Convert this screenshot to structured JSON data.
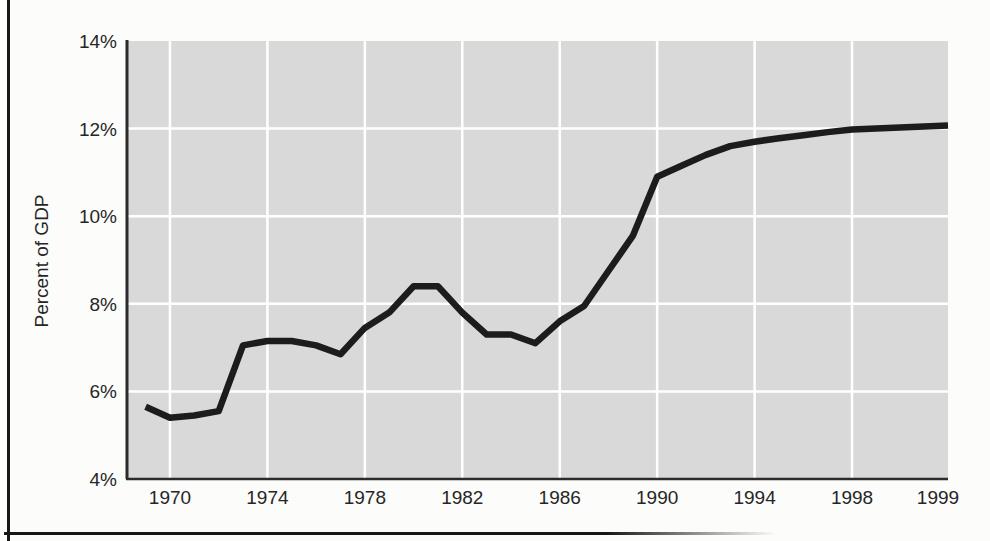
{
  "figure": {
    "ylabel": "Percent of GDP",
    "colors": {
      "plot_background": "#d9d9d9",
      "gridline": "#ffffff",
      "axis_line": "#2b2b2b",
      "data_line": "#1c1c1c",
      "page_background": "#fcfcfa",
      "text": "#262626",
      "frame": "#161616"
    }
  },
  "chart_data": {
    "type": "line",
    "title": "",
    "xlabel": "",
    "ylabel": "Percent of GDP",
    "x": [
      1969,
      1970,
      1971,
      1972,
      1973,
      1974,
      1975,
      1976,
      1977,
      1978,
      1979,
      1980,
      1981,
      1982,
      1983,
      1984,
      1985,
      1986,
      1987,
      1988,
      1989,
      1990,
      1991,
      1992,
      1993,
      1994,
      1995,
      1996,
      1997,
      1998,
      1999
    ],
    "values": [
      5.65,
      5.4,
      5.45,
      5.55,
      7.05,
      7.15,
      7.15,
      7.05,
      6.85,
      7.45,
      7.8,
      8.4,
      8.4,
      7.8,
      7.3,
      7.3,
      7.1,
      7.6,
      7.95,
      8.75,
      9.55,
      10.9,
      11.15,
      11.4,
      11.6,
      11.7,
      11.78,
      11.85,
      11.92,
      11.98,
      12.07
    ],
    "x_ticks": [
      {
        "year": 1970,
        "label": "1970"
      },
      {
        "year": 1974,
        "label": "1974"
      },
      {
        "year": 1978,
        "label": "1978"
      },
      {
        "year": 1982,
        "label": "1982"
      },
      {
        "year": 1986,
        "label": "1986"
      },
      {
        "year": 1990,
        "label": "1990"
      },
      {
        "year": 1994,
        "label": "1994"
      },
      {
        "year": 1998,
        "label": "1998"
      },
      {
        "year": 1999,
        "label": "1999"
      }
    ],
    "y_ticks": [
      {
        "value": 14,
        "label": "14%"
      },
      {
        "value": 12,
        "label": "12%"
      },
      {
        "value": 10,
        "label": "10%"
      },
      {
        "value": 8,
        "label": "8%"
      },
      {
        "value": 6,
        "label": "6%"
      },
      {
        "value": 4,
        "label": "4%"
      }
    ],
    "ylim": [
      4,
      14
    ],
    "xlim": [
      1969,
      1999
    ],
    "grid": true,
    "legend": "none",
    "note_axis": "final tick 1999 occupies a full gridline-width slot at the right edge"
  }
}
